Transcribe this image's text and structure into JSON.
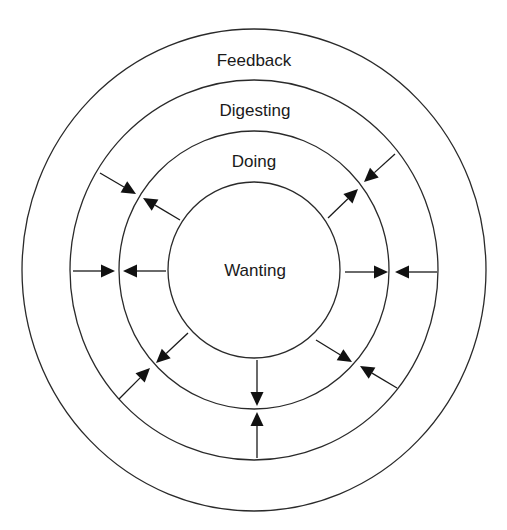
{
  "diagram": {
    "type": "concentric-circles",
    "center": {
      "x": 254,
      "y": 270
    },
    "colors": {
      "stroke": "#2a2a2a",
      "text": "#1a1a1a",
      "background": "#ffffff"
    },
    "rings": [
      {
        "name": "feedback",
        "label": "Feedback",
        "rx": 232,
        "ry": 241,
        "label_pos": {
          "x": 254,
          "y": 66
        }
      },
      {
        "name": "digesting",
        "label": "Digesting",
        "rx": 184,
        "ry": 190,
        "label_pos": {
          "x": 255,
          "y": 116
        }
      },
      {
        "name": "doing",
        "label": "Doing",
        "rx": 135,
        "ry": 139,
        "label_pos": {
          "x": 254,
          "y": 167
        }
      },
      {
        "name": "wanting",
        "label": "Wanting",
        "rx": 86,
        "ry": 88,
        "label_pos": {
          "x": 255,
          "y": 276
        }
      }
    ],
    "arrows": [
      {
        "name": "upper-left-outer",
        "from": [
          100,
          173
        ],
        "to": [
          136,
          194
        ],
        "direction": "inward"
      },
      {
        "name": "upper-left-inner",
        "from": [
          180,
          220
        ],
        "to": [
          143,
          198
        ],
        "direction": "outward"
      },
      {
        "name": "upper-right-outer",
        "from": [
          395,
          154
        ],
        "to": [
          364,
          182
        ],
        "direction": "inward"
      },
      {
        "name": "upper-right-inner",
        "from": [
          328,
          218
        ],
        "to": [
          358,
          189
        ],
        "direction": "outward"
      },
      {
        "name": "left-outer",
        "from": [
          73,
          271
        ],
        "to": [
          115,
          271
        ],
        "direction": "inward"
      },
      {
        "name": "left-inner",
        "from": [
          166,
          271
        ],
        "to": [
          123,
          271
        ],
        "direction": "outward"
      },
      {
        "name": "right-inner",
        "from": [
          345,
          272
        ],
        "to": [
          388,
          272
        ],
        "direction": "outward"
      },
      {
        "name": "right-outer",
        "from": [
          437,
          272
        ],
        "to": [
          395,
          272
        ],
        "direction": "inward"
      },
      {
        "name": "lower-left-outer",
        "from": [
          119,
          399
        ],
        "to": [
          150,
          368
        ],
        "direction": "inward"
      },
      {
        "name": "lower-left-inner",
        "from": [
          188,
          333
        ],
        "to": [
          156,
          363
        ],
        "direction": "outward"
      },
      {
        "name": "lower-right-inner",
        "from": [
          316,
          340
        ],
        "to": [
          352,
          362
        ],
        "direction": "outward"
      },
      {
        "name": "lower-right-outer",
        "from": [
          397,
          388
        ],
        "to": [
          360,
          366
        ],
        "direction": "inward"
      },
      {
        "name": "bottom-inner",
        "from": [
          257,
          360
        ],
        "to": [
          257,
          406
        ],
        "direction": "outward"
      },
      {
        "name": "bottom-outer",
        "from": [
          257,
          458
        ],
        "to": [
          257,
          412
        ],
        "direction": "inward"
      }
    ]
  }
}
